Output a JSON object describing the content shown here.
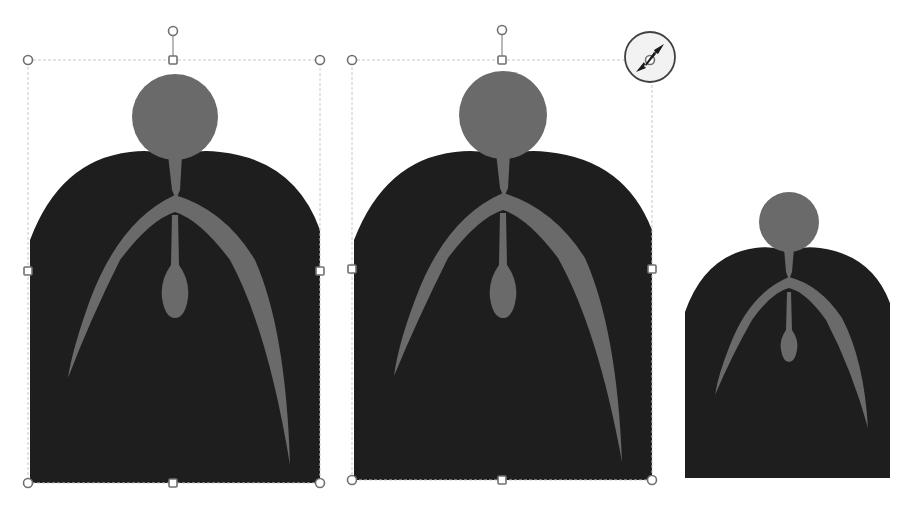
{
  "canvas": {
    "width": 908,
    "height": 506,
    "background": "#ffffff"
  },
  "colors": {
    "body": "#1e1e1e",
    "accent_gray": "#6a6a6a",
    "handle_stroke": "#707070",
    "frame": "#c8c8c8"
  },
  "shapes": [
    {
      "id": "figure-1",
      "state": "selected",
      "frame": {
        "x": 28,
        "y": 60,
        "w": 292,
        "h": 423
      },
      "rotation_handle": {
        "x": 173,
        "y": 31
      }
    },
    {
      "id": "figure-2",
      "state": "resizing",
      "frame": {
        "x": 352,
        "y": 60,
        "w": 300,
        "h": 420
      },
      "rotation_handle": {
        "x": 502,
        "y": 30
      },
      "cursor": "resize-diagonal-cursor"
    },
    {
      "id": "figure-3",
      "state": "result",
      "frame": {
        "x": 684,
        "y": 192,
        "w": 206,
        "h": 286
      }
    }
  ]
}
